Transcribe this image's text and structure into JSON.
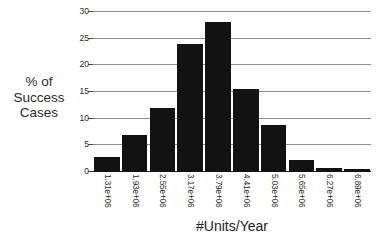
{
  "chart_data": {
    "type": "bar",
    "title": "",
    "subtitle": "",
    "xlabel": "#Units/Year",
    "ylabel": "% of Success Cases",
    "ylabel_lines": [
      "% of",
      "Success",
      "Cases"
    ],
    "categories": [
      "1.31e+06",
      "1.93e+06",
      "2.55e+06",
      "3.17e+06",
      "3.79e+06",
      "4.41e+06",
      "5.03e+06",
      "5.65e+06",
      "6.27e+06",
      "6.89e+06"
    ],
    "values": [
      2.8,
      7.0,
      12.0,
      24.0,
      28.1,
      15.6,
      8.9,
      2.3,
      0.8,
      0.6
    ],
    "ylim": [
      0,
      30
    ],
    "yticks": [
      0,
      5,
      10,
      15,
      20,
      25,
      30
    ],
    "ytick_labels": [
      "0",
      "5",
      "10",
      "15",
      "20",
      "25",
      "30"
    ],
    "grid": true,
    "grid_axis": "y",
    "legend": false,
    "legend_position": "none",
    "xtick_rotation": 90,
    "bar_color": "#121212",
    "grid_color": "#8e8e8e",
    "axis_color": "#2a2a2a",
    "background_color": "#ffffff"
  }
}
